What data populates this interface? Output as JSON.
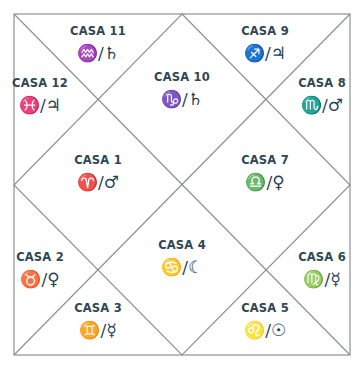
{
  "chart": {
    "colors": {
      "line": "#8c9196",
      "label": "#2e4656",
      "symbol": "#1e4055",
      "background": "#ffffff"
    },
    "houses": [
      {
        "number": 1,
        "label": "CASA 1",
        "sign": "aries",
        "planet": "mars",
        "symbols": "♈/♂"
      },
      {
        "number": 2,
        "label": "CASA 2",
        "sign": "taurus",
        "planet": "venus",
        "symbols": "♉/♀"
      },
      {
        "number": 3,
        "label": "CASA 3",
        "sign": "gemini",
        "planet": "mercury",
        "symbols": "♊/☿"
      },
      {
        "number": 4,
        "label": "CASA 4",
        "sign": "cancer",
        "planet": "moon",
        "symbols": "♋/☾"
      },
      {
        "number": 5,
        "label": "CASA 5",
        "sign": "leo",
        "planet": "sun",
        "symbols": "♌/☉"
      },
      {
        "number": 6,
        "label": "CASA 6",
        "sign": "virgo",
        "planet": "mercury",
        "symbols": "♍/☿"
      },
      {
        "number": 7,
        "label": "CASA 7",
        "sign": "libra",
        "planet": "venus",
        "symbols": "♎/♀"
      },
      {
        "number": 8,
        "label": "CASA 8",
        "sign": "scorpio",
        "planet": "mars",
        "symbols": "♏/♂"
      },
      {
        "number": 9,
        "label": "CASA 9",
        "sign": "sagittarius",
        "planet": "jupiter",
        "symbols": "♐/♃"
      },
      {
        "number": 10,
        "label": "CASA 10",
        "sign": "capricorn",
        "planet": "saturn",
        "symbols": "♑/♄"
      },
      {
        "number": 11,
        "label": "CASA 11",
        "sign": "aquarius",
        "planet": "saturn",
        "symbols": "♒/♄"
      },
      {
        "number": 12,
        "label": "CASA 12",
        "sign": "pisces",
        "planet": "jupiter",
        "symbols": "♓/♃"
      }
    ]
  }
}
